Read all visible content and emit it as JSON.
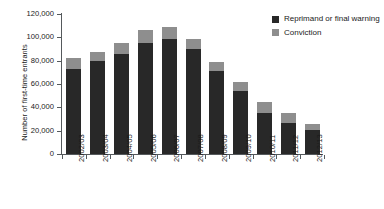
{
  "chart_data": {
    "type": "bar",
    "subtype": "stacked-vertical",
    "title": "",
    "xlabel": "",
    "ylabel": "Number of first-time entrants",
    "ylim": [
      0,
      120000
    ],
    "ytick_labels": [
      "0",
      "20,000",
      "40,000",
      "60,000",
      "80,000",
      "100,000",
      "120,000"
    ],
    "ytick_values": [
      0,
      20000,
      40000,
      60000,
      80000,
      100000,
      120000
    ],
    "grid": false,
    "legend_position": "top-right",
    "categories": [
      "2002/03",
      "2003/04",
      "2004/05",
      "2005/06",
      "2006/07",
      "2007/08",
      "2008/09",
      "2009/10",
      "2010/11",
      "2011/12",
      "2012/13"
    ],
    "series": [
      {
        "name": "Reprimand or final warning",
        "color": "#282828",
        "values": [
          72500,
          79500,
          85500,
          95000,
          98500,
          90000,
          71500,
          54000,
          35500,
          27000,
          20500
        ]
      },
      {
        "name": "Conviction",
        "color": "#8e8e8e",
        "values": [
          10000,
          8000,
          9500,
          11500,
          10500,
          9000,
          7000,
          8000,
          9000,
          8000,
          5000
        ]
      }
    ],
    "totals": [
      82500,
      87500,
      95000,
      106500,
      109000,
      99000,
      78500,
      62000,
      44500,
      35000,
      25500
    ]
  },
  "legend": {
    "items": [
      {
        "label": "Reprimand or final warning",
        "color": "#282828"
      },
      {
        "label": "Conviction",
        "color": "#8e8e8e"
      }
    ]
  },
  "colors": {
    "axis": "#55595c",
    "text": "#1a1a1a",
    "background": "#ffffff",
    "reprimand": "#282828",
    "conviction": "#8e8e8e"
  }
}
